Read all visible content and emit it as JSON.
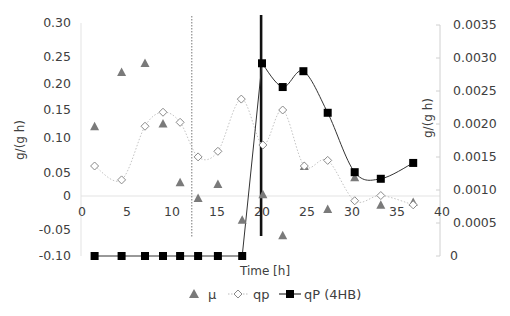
{
  "chart_data": {
    "type": "scatter",
    "title": "",
    "xlabel": "Time [h]",
    "ylabel_left": "g/(g h)",
    "ylabel_right": "g/(g h)",
    "x_range": [
      0,
      40
    ],
    "x_ticks": [
      0,
      5,
      10,
      15,
      20,
      25,
      30,
      35,
      40
    ],
    "y_left_ticks": [
      {
        "value": 0.3,
        "label": "0.30",
        "py": 23
      },
      {
        "value": 0.25,
        "label": "0.25",
        "py": 57
      },
      {
        "value": 0.2,
        "label": "0.20",
        "py": 84
      },
      {
        "value": 0.15,
        "label": "0.15",
        "py": 110
      },
      {
        "value": 0.1,
        "label": "0.10",
        "py": 138
      },
      {
        "value": 0.05,
        "label": "0.05",
        "py": 173
      },
      {
        "value": 0,
        "label": "0",
        "py": 196
      },
      {
        "value": -0.05,
        "label": "-0.05",
        "py": 230
      },
      {
        "value": -0.1,
        "label": "-0.10",
        "py": 256
      }
    ],
    "y_right_ticks": [
      "0",
      "0.0005",
      "0.0010",
      "0.0015",
      "0.0020",
      "0.0025",
      "0.0030",
      "0.0035"
    ],
    "y_right_range": [
      0,
      0.0035
    ],
    "vertical_markers": [
      {
        "x": 12.2,
        "style": "dotted"
      },
      {
        "x": 19.9,
        "style": "thick-solid"
      }
    ],
    "legend_position": "bottom",
    "grid": false,
    "series": [
      {
        "name": "μ",
        "axis": "left",
        "marker": "triangle",
        "line": "none",
        "color": "#7a7a7a",
        "x": [
          1.4,
          4.4,
          7.0,
          9.0,
          10.9,
          12.9,
          15.1,
          17.8,
          20.1,
          22.3,
          24.7,
          27.3,
          30.3,
          33.2,
          36.8
        ],
        "values": [
          0.121,
          0.222,
          0.239,
          0.126,
          0.03,
          -0.003,
          0.026,
          -0.035,
          0.004,
          -0.06,
          0.06,
          -0.019,
          0.041,
          -0.013,
          -0.009
        ]
      },
      {
        "name": "qp",
        "axis": "left",
        "marker": "diamond-open",
        "line": "dotted-smooth",
        "color": "#bdbdbd",
        "x": [
          1.4,
          4.4,
          7.0,
          9.0,
          10.9,
          12.9,
          15.1,
          17.7,
          20.1,
          22.3,
          24.7,
          27.3,
          30.3,
          33.2,
          36.8
        ],
        "values": [
          0.06,
          0.035,
          0.121,
          0.146,
          0.128,
          0.073,
          0.081,
          0.171,
          0.09,
          0.15,
          0.06,
          0.068,
          -0.007,
          0.001,
          -0.013
        ]
      },
      {
        "name": "qP (4HB)",
        "axis": "right",
        "marker": "square-filled",
        "line": "solid-smooth",
        "color": "#000000",
        "x": [
          1.4,
          4.4,
          7.0,
          9.0,
          10.9,
          12.9,
          15.1,
          17.8,
          20.0,
          22.3,
          24.6,
          27.3,
          30.3,
          33.2,
          36.8
        ],
        "values": [
          0,
          0,
          0,
          0,
          0,
          0,
          0,
          0,
          0.00292,
          0.00256,
          0.0028,
          0.00217,
          0.00127,
          0.00117,
          0.00141
        ]
      }
    ]
  },
  "legend": {
    "items": [
      {
        "label": "μ",
        "marker": "triangle"
      },
      {
        "label": "qp",
        "marker": "diamond-open"
      },
      {
        "label": "qP (4HB)",
        "marker": "square-filled"
      }
    ]
  },
  "axes": {
    "xlabel": "Time [h]",
    "ylabel_left": "g/(g h)",
    "ylabel_right": "g/(g h)"
  }
}
